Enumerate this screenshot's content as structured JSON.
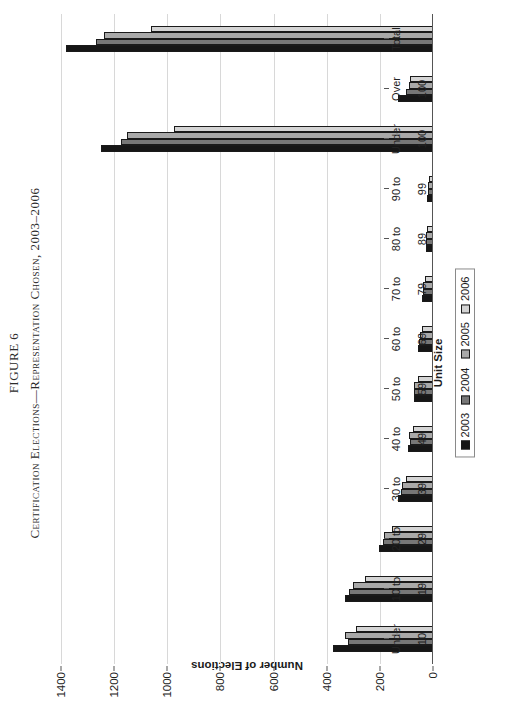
{
  "figure": {
    "label": "FIGURE 6",
    "caption": "Certification Elections—Representation Chosen, 2003–2006"
  },
  "chart_data": {
    "type": "bar",
    "title": "Certification Elections—Representation Chosen, 2003–2006",
    "xlabel": "Unit Size",
    "ylabel": "Number of Elections",
    "ylim": [
      0,
      1400
    ],
    "yticks": [
      1400,
      1200,
      1000,
      800,
      600,
      400,
      200,
      0
    ],
    "grid": true,
    "legend_position": "bottom-center",
    "orientation": "vertical-bars-rotated-page",
    "categories": [
      "Under 10",
      "10 to 19",
      "20 to 29",
      "30 to 39",
      "40 to 49",
      "50 to 59",
      "60 to 69",
      "70 to 79",
      "80 to 89",
      "90 to 99",
      "Under 100",
      "Over 100",
      "Total"
    ],
    "series": [
      {
        "name": "2003",
        "color": "#161616",
        "values": [
          375,
          330,
          205,
          130,
          95,
          70,
          55,
          40,
          28,
          22,
          1250,
          130,
          1380
        ]
      },
      {
        "name": "2004",
        "color": "#777777",
        "values": [
          320,
          315,
          190,
          120,
          88,
          70,
          52,
          38,
          27,
          20,
          1175,
          100,
          1270
        ]
      },
      {
        "name": "2005",
        "color": "#a9a9a9",
        "values": [
          330,
          300,
          185,
          118,
          90,
          72,
          50,
          36,
          25,
          18,
          1150,
          90,
          1240
        ]
      },
      {
        "name": "2006",
        "color": "#d4d4d4",
        "values": [
          290,
          255,
          155,
          100,
          75,
          58,
          42,
          30,
          22,
          15,
          975,
          85,
          1060
        ]
      }
    ]
  },
  "legend": {
    "items": [
      {
        "label": "2003",
        "color": "#161616"
      },
      {
        "label": "2004",
        "color": "#777777"
      },
      {
        "label": "2005",
        "color": "#a9a9a9"
      },
      {
        "label": "2006",
        "color": "#d4d4d4"
      }
    ]
  }
}
